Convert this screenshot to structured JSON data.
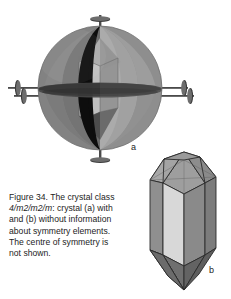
{
  "figure": {
    "number": "Figure 34.",
    "caption_line1": "Figure 34. The crystal class",
    "caption_symbol": "4/m2/m2/m",
    "caption_line2_rest": ": crystal (a) with",
    "caption_line3": "and (b) without information",
    "caption_line4": "about symmetry elements.",
    "caption_line5": "The centre of symmetry is",
    "caption_line6": "not shown.",
    "caption_full": "Figure 34. The crystal class 4/m2/m2/m: crystal (a) with and (b) without information about symmetry elements. The centre of symmetry is not shown."
  },
  "panels": {
    "a": {
      "label": "a",
      "description": "Tetragonal crystal enclosed in a sphere showing symmetry elements: vertical 4-fold axis, horizontal mirror plane, vertical mirror planes and 2-fold axes"
    },
    "b": {
      "label": "b",
      "description": "Tetragonal dipyramidal crystal without symmetry elements"
    }
  },
  "colors": {
    "background": "#ffffff",
    "sphere_left": "#7c7c7c",
    "sphere_mid": "#8e8e8e",
    "sphere_light": "#a6a6a6",
    "sphere_dark": "#6a6a6a",
    "mirror_black": "#111111",
    "crystal_light_face": "#d8d8d8",
    "crystal_mid_face": "#8c8c8c",
    "crystal_dark_face": "#6b6b6b",
    "crystal_top_face": "#9a9a9a",
    "outline": "#2a2a2a",
    "axis_marker": "#3a3a3a",
    "text": "#1c1c1c"
  }
}
